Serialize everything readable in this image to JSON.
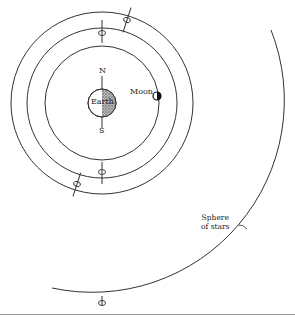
{
  "diagram": {
    "type": "geocentric-model",
    "labels": {
      "north": "N",
      "south": "S",
      "earth": "Earth",
      "moon": "Moon",
      "sphere_line1": "Sphere",
      "sphere_line2": "of stars"
    },
    "elements": {
      "center": [
        103,
        103
      ],
      "earth_radius": 14,
      "orbits": [
        {
          "name": "inner-orbit",
          "radius": 57
        },
        {
          "name": "middle-orbit",
          "radius": 75
        },
        {
          "name": "outer-orbit",
          "radius": 91
        }
      ],
      "sphere_of_stars_radius": 192,
      "moon_position": [
        157,
        96
      ],
      "rotation_axis_symbols": [
        {
          "name": "middle-orbit-top-axis",
          "orbit": "middle",
          "position": "top"
        },
        {
          "name": "middle-orbit-bottom-axis",
          "orbit": "middle",
          "position": "bottom"
        },
        {
          "name": "outer-orbit-upper-right-axis",
          "orbit": "outer",
          "position": "upper-right"
        },
        {
          "name": "outer-orbit-lower-left-axis",
          "orbit": "outer",
          "position": "lower-left"
        },
        {
          "name": "sphere-bottom-axis",
          "orbit": "sphere",
          "position": "bottom"
        }
      ]
    },
    "colors": {
      "line": "#333333",
      "earth_shade": "#7a7a7a",
      "moon_dark": "#111111",
      "rule": "#9a9a9a"
    }
  }
}
